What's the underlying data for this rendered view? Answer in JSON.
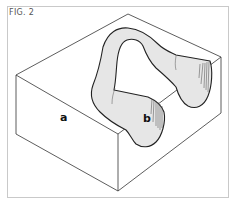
{
  "figure": {
    "label": "FIG. 2",
    "labels": {
      "a": "a",
      "b": "b"
    },
    "colors": {
      "line": "#333333",
      "tube_fill": "#e6e6e6",
      "frame": "#c9c9c9",
      "background": "#ffffff"
    }
  }
}
